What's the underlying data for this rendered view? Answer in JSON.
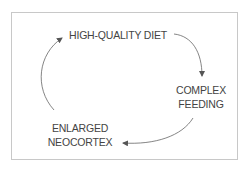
{
  "diagram": {
    "type": "cycle",
    "nodes": [
      {
        "id": "diet",
        "label": "HIGH-QUALITY DIET"
      },
      {
        "id": "feeding",
        "line1": "COMPLEX",
        "line2": "FEEDING"
      },
      {
        "id": "neocortex",
        "line1": "ENLARGED",
        "line2": "NEOCORTEX"
      }
    ],
    "edges": [
      {
        "from": "diet",
        "to": "feeding"
      },
      {
        "from": "feeding",
        "to": "neocortex"
      },
      {
        "from": "neocortex",
        "to": "diet"
      }
    ],
    "colors": {
      "text": "#444444",
      "arrow": "#555555",
      "border": "#c8c8c8"
    }
  }
}
